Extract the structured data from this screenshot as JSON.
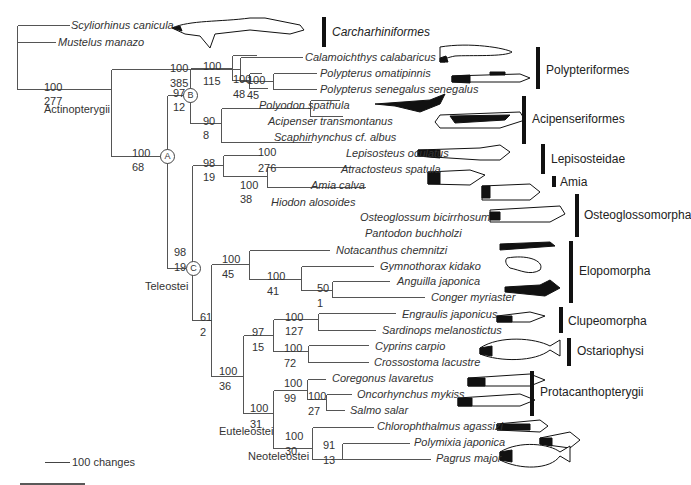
{
  "figure": {
    "type": "phylogenetic tree",
    "scale_bar": {
      "label": "100 changes"
    }
  },
  "taxa": [
    {
      "name": "Scyliorhinus canicula",
      "x": 71,
      "y": 19
    },
    {
      "name": "Mustelus manazo",
      "x": 58,
      "y": 36
    },
    {
      "name": "Calamoichthys calabaricus",
      "x": 305,
      "y": 51
    },
    {
      "name": "Polypterus omatipinnis",
      "x": 320,
      "y": 67
    },
    {
      "name": "Polypterus senegalus senegalus",
      "x": 320,
      "y": 83
    },
    {
      "name": "Polyodon spathula",
      "x": 259,
      "y": 99
    },
    {
      "name": "Acipenser transmontanus",
      "x": 268,
      "y": 115
    },
    {
      "name": "Scaphirhynchus cf. albus",
      "x": 274,
      "y": 131
    },
    {
      "name": "Lepisosteus oculatus",
      "x": 346,
      "y": 147
    },
    {
      "name": "Atractosteus spatula",
      "x": 341,
      "y": 163
    },
    {
      "name": "Amia calva",
      "x": 311,
      "y": 179
    },
    {
      "name": "Hiodon alosoides",
      "x": 271,
      "y": 196
    },
    {
      "name": "Osteoglossum bicirrhosum",
      "x": 360,
      "y": 211
    },
    {
      "name": "Pantodon buchholzi",
      "x": 365,
      "y": 227
    },
    {
      "name": "Notacanthus chemnitzi",
      "x": 336,
      "y": 244
    },
    {
      "name": "Gymnothorax kidako",
      "x": 380,
      "y": 260
    },
    {
      "name": "Anguilla japonica",
      "x": 397,
      "y": 275
    },
    {
      "name": "Conger myriaster",
      "x": 431,
      "y": 291
    },
    {
      "name": "Engraulis japonicus",
      "x": 402,
      "y": 308
    },
    {
      "name": "Sardinops melanostictus",
      "x": 382,
      "y": 324
    },
    {
      "name": "Cyprins carpio",
      "x": 375,
      "y": 340
    },
    {
      "name": "Crossostoma lacustre",
      "x": 374,
      "y": 356
    },
    {
      "name": "Coregonus lavaretus",
      "x": 332,
      "y": 372
    },
    {
      "name": "Oncorhynchus mykiss",
      "x": 357,
      "y": 388
    },
    {
      "name": "Salmo salar",
      "x": 350,
      "y": 404
    },
    {
      "name": "Chlorophthalmus agassizi",
      "x": 377,
      "y": 420
    },
    {
      "name": "Polymixia japonica",
      "x": 414,
      "y": 436
    },
    {
      "name": "Pagrus major",
      "x": 436,
      "y": 452
    }
  ],
  "support_values": [
    {
      "top": "100",
      "bottom": "277",
      "x": 44,
      "yt": 81,
      "yb": 95
    },
    {
      "top": "100",
      "bottom": "385",
      "x": 170,
      "yt": 62,
      "yb": 77
    },
    {
      "top": "100",
      "bottom": "45",
      "x": 247,
      "yt": 74,
      "yb": 89
    },
    {
      "top": "100",
      "bottom": "68",
      "x": 132,
      "yt": 147,
      "yb": 161
    },
    {
      "top": "97",
      "bottom": "12",
      "x": 173,
      "yt": 87,
      "yb": 101
    },
    {
      "top": "100",
      "bottom": "115",
      "x": 203,
      "yt": 60,
      "yb": 75
    },
    {
      "top": "100",
      "bottom": "48",
      "x": 233,
      "yt": 73,
      "yb": 88
    },
    {
      "top": "90",
      "bottom": "8",
      "x": 203,
      "yt": 115,
      "yb": 129
    },
    {
      "top": "100",
      "bottom": "276",
      "x": 258,
      "yt": 146,
      "yb": 162
    },
    {
      "top": "98",
      "bottom": "19",
      "x": 203,
      "yt": 157,
      "yb": 171
    },
    {
      "top": "100",
      "bottom": "38",
      "x": 240,
      "yt": 179,
      "yb": 193
    },
    {
      "top": "98",
      "bottom": "19",
      "x": 174,
      "yt": 246,
      "yb": 261
    },
    {
      "top": "100",
      "bottom": "45",
      "x": 222,
      "yt": 253,
      "yb": 268
    },
    {
      "top": "100",
      "bottom": "41",
      "x": 267,
      "yt": 270,
      "yb": 285
    },
    {
      "top": "50",
      "bottom": "1",
      "x": 317,
      "yt": 282,
      "yb": 297
    },
    {
      "top": "61",
      "bottom": "2",
      "x": 200,
      "yt": 311,
      "yb": 326
    },
    {
      "top": "100",
      "bottom": "127",
      "x": 285,
      "yt": 311,
      "yb": 325
    },
    {
      "top": "97",
      "bottom": "15",
      "x": 252,
      "yt": 326,
      "yb": 341
    },
    {
      "top": "100",
      "bottom": "72",
      "x": 284,
      "yt": 342,
      "yb": 357
    },
    {
      "top": "100",
      "bottom": "36",
      "x": 219,
      "yt": 365,
      "yb": 380
    },
    {
      "top": "100",
      "bottom": "99",
      "x": 284,
      "yt": 377,
      "yb": 392
    },
    {
      "top": "100",
      "bottom": "27",
      "x": 308,
      "yt": 390,
      "yb": 405
    },
    {
      "top": "100",
      "bottom": "31",
      "x": 250,
      "yt": 402,
      "yb": 418
    },
    {
      "top": "100",
      "bottom": "30",
      "x": 285,
      "yt": 430,
      "yb": 445
    },
    {
      "top": "91",
      "bottom": "13",
      "x": 323,
      "yt": 439,
      "yb": 454
    }
  ],
  "node_labels": [
    {
      "label": "A",
      "x": 160,
      "y": 149
    },
    {
      "label": "B",
      "x": 183,
      "y": 88
    },
    {
      "label": "C",
      "x": 186,
      "y": 261
    }
  ],
  "group_labels": [
    {
      "name": "Actinopterygii",
      "x": 44,
      "y": 103
    },
    {
      "name": "Teleostei",
      "x": 145,
      "y": 280
    },
    {
      "name": "Euteleostei",
      "x": 219,
      "y": 425
    },
    {
      "name": "Neoteleostei",
      "x": 248,
      "y": 450
    }
  ],
  "clades": [
    {
      "name": "Carcharhiniformes",
      "italic": true,
      "bar_x": 322,
      "bar_y1": 17,
      "bar_y2": 47,
      "label_x": 332,
      "label_y": 26
    },
    {
      "name": "Polypteriformes",
      "italic": false,
      "bar_x": 536,
      "bar_y1": 47,
      "bar_y2": 89,
      "label_x": 546,
      "label_y": 64
    },
    {
      "name": "Acipenseriformes",
      "italic": false,
      "bar_x": 522,
      "bar_y1": 96,
      "bar_y2": 144,
      "label_x": 532,
      "label_y": 113
    },
    {
      "name": "Lepisosteidae",
      "italic": false,
      "bar_x": 541,
      "bar_y1": 144,
      "bar_y2": 174,
      "label_x": 551,
      "label_y": 153
    },
    {
      "name": "Amia",
      "italic": false,
      "bar_x": 552,
      "bar_y1": 176,
      "bar_y2": 187,
      "label_x": 560,
      "label_y": 176
    },
    {
      "name": "Osteoglossomorpha",
      "italic": false,
      "bar_x": 575,
      "bar_y1": 194,
      "bar_y2": 237,
      "label_x": 584,
      "label_y": 209
    },
    {
      "name": "Elopomorpha",
      "italic": false,
      "bar_x": 569,
      "bar_y1": 241,
      "bar_y2": 303,
      "label_x": 579,
      "label_y": 265
    },
    {
      "name": "Clupeomorpha",
      "italic": false,
      "bar_x": 559,
      "bar_y1": 307,
      "bar_y2": 333,
      "label_x": 568,
      "label_y": 315
    },
    {
      "name": "Ostariophysi",
      "italic": false,
      "bar_x": 567,
      "bar_y1": 338,
      "bar_y2": 366,
      "label_x": 577,
      "label_y": 345
    },
    {
      "name": "Protacanthopterygii",
      "italic": false,
      "bar_x": 530,
      "bar_y1": 371,
      "bar_y2": 416,
      "label_x": 540,
      "label_y": 386
    }
  ],
  "scale": {
    "label": "100 changes",
    "line_x1": 45,
    "line_x2": 70,
    "y": 462,
    "label_x": 72,
    "label_y": 456
  },
  "bottom_rule": {
    "x1": 20,
    "x2": 85,
    "y": 484
  }
}
